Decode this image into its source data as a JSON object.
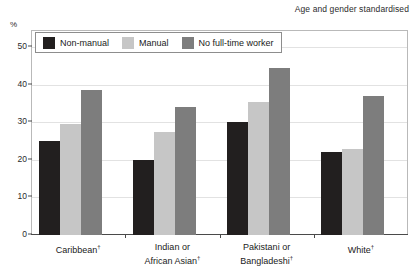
{
  "note": "Age and gender standardised",
  "axis": {
    "unit_label": "%",
    "yticks": [
      "0",
      "10",
      "20",
      "30",
      "40",
      "50"
    ]
  },
  "legend": {
    "items": [
      {
        "label": "Non-manual",
        "color": "#221f1f"
      },
      {
        "label": "Manual",
        "color": "#c6c6c6"
      },
      {
        "label": "No full-time worker",
        "color": "#7d7d7d"
      }
    ]
  },
  "categories": [
    {
      "line1": "Caribbean",
      "line2": "",
      "marker": "†"
    },
    {
      "line1": "Indian or",
      "line2": "African Asian",
      "marker": "†"
    },
    {
      "line1": "Pakistani or",
      "line2": "Bangladeshi",
      "marker": "†"
    },
    {
      "line1": "White",
      "line2": "",
      "marker": "†"
    }
  ],
  "chart_data": {
    "type": "bar",
    "title": "",
    "subtitle": "Age and gender standardised",
    "xlabel": "",
    "ylabel": "%",
    "ylim": [
      0,
      55
    ],
    "yticks": [
      0,
      10,
      20,
      30,
      40,
      50
    ],
    "grid": true,
    "legend_position": "top-left-inside",
    "categories": [
      "Caribbean",
      "Indian or African Asian",
      "Pakistani or Bangladeshi",
      "White"
    ],
    "series": [
      {
        "name": "Non-manual",
        "color": "#221f1f",
        "values": [
          25,
          20,
          30,
          22
        ]
      },
      {
        "name": "Manual",
        "color": "#c6c6c6",
        "values": [
          29.5,
          27.5,
          35.5,
          23
        ]
      },
      {
        "name": "No full-time worker",
        "color": "#7d7d7d",
        "values": [
          38.5,
          34,
          44.5,
          37
        ]
      }
    ]
  }
}
